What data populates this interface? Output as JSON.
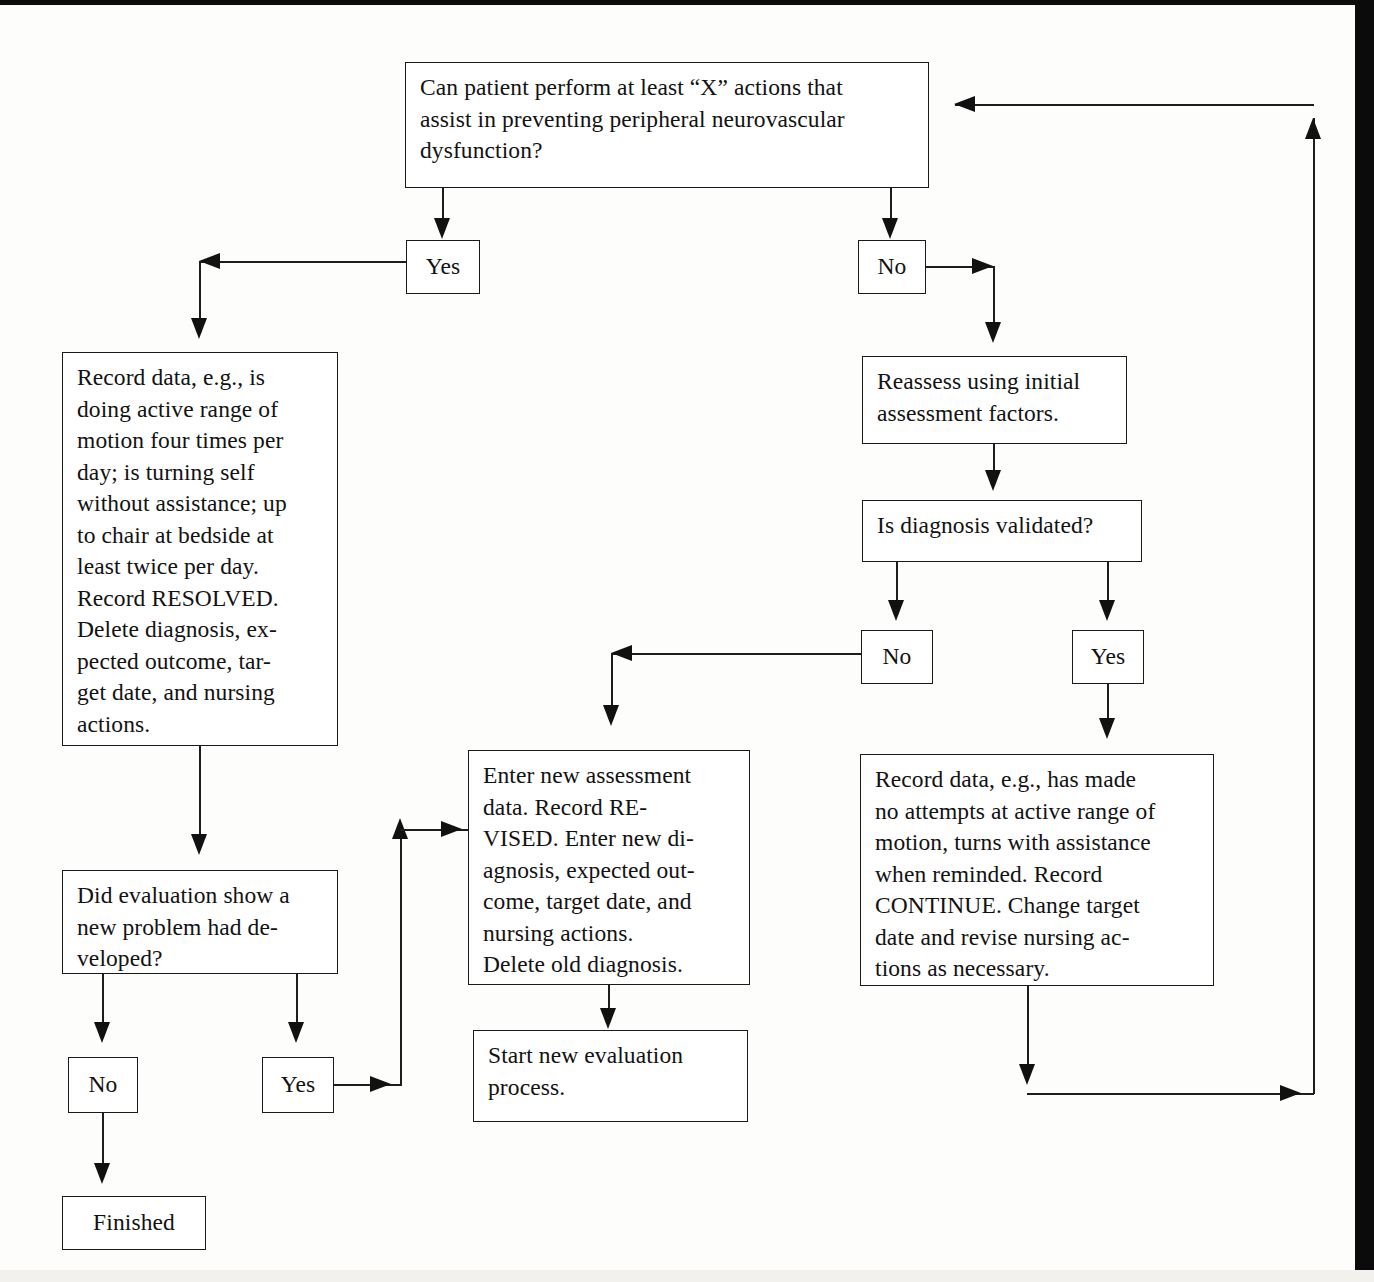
{
  "diagram": {
    "type": "flowchart",
    "nodes": {
      "question_top": {
        "label": "Can patient perform at least “X” actions that\nassist in preventing peripheral neurovascular\ndysfunction?",
        "shape": "rectangle"
      },
      "yes_top": {
        "label": "Yes",
        "shape": "rectangle"
      },
      "no_top": {
        "label": "No",
        "shape": "rectangle"
      },
      "record_resolved": {
        "label": "Record data, e.g., is\ndoing active range of\nmotion four times per\nday; is turning self\nwithout assistance; up\nto chair at bedside at\nleast twice per day.\nRecord RESOLVED.\nDelete diagnosis, ex-\npected outcome, tar-\nget date, and nursing\nactions.",
        "shape": "rectangle"
      },
      "reassess": {
        "label": "Reassess using initial\nassessment factors.",
        "shape": "rectangle"
      },
      "is_validated": {
        "label": "Is diagnosis validated?",
        "shape": "rectangle"
      },
      "no_mid": {
        "label": "No",
        "shape": "rectangle"
      },
      "yes_mid": {
        "label": "Yes",
        "shape": "rectangle"
      },
      "did_evaluation": {
        "label": "Did evaluation show a\nnew problem had de-\nveloped?",
        "shape": "rectangle"
      },
      "enter_new": {
        "label": "Enter new assessment\ndata. Record RE-\nVISED. Enter new di-\nagnosis, expected out-\ncome, target date, and\nnursing actions.\nDelete old diagnosis.",
        "shape": "rectangle"
      },
      "record_continue": {
        "label": "Record data, e.g., has made\nno attempts at active range of\nmotion, turns with assistance\nwhen reminded. Record\nCONTINUE. Change target\ndate and revise nursing ac-\ntions as necessary.",
        "shape": "rectangle"
      },
      "no_bottom": {
        "label": "No",
        "shape": "rectangle"
      },
      "yes_bottom": {
        "label": "Yes",
        "shape": "rectangle"
      },
      "start_new": {
        "label": "Start new evaluation\nprocess.",
        "shape": "rectangle"
      },
      "finished": {
        "label": "Finished",
        "shape": "rectangle"
      }
    },
    "edges": [
      {
        "from": "question_top",
        "to": "yes_top",
        "label": ""
      },
      {
        "from": "question_top",
        "to": "no_top",
        "label": ""
      },
      {
        "from": "yes_top",
        "to": "record_resolved",
        "label": ""
      },
      {
        "from": "no_top",
        "to": "reassess",
        "label": ""
      },
      {
        "from": "reassess",
        "to": "is_validated",
        "label": ""
      },
      {
        "from": "is_validated",
        "to": "no_mid",
        "label": ""
      },
      {
        "from": "is_validated",
        "to": "yes_mid",
        "label": ""
      },
      {
        "from": "no_mid",
        "to": "enter_new",
        "label": ""
      },
      {
        "from": "yes_mid",
        "to": "record_continue",
        "label": ""
      },
      {
        "from": "record_resolved",
        "to": "did_evaluation",
        "label": ""
      },
      {
        "from": "did_evaluation",
        "to": "no_bottom",
        "label": ""
      },
      {
        "from": "did_evaluation",
        "to": "yes_bottom",
        "label": ""
      },
      {
        "from": "no_bottom",
        "to": "finished",
        "label": ""
      },
      {
        "from": "yes_bottom",
        "to": "enter_new",
        "label": ""
      },
      {
        "from": "enter_new",
        "to": "start_new",
        "label": ""
      },
      {
        "from": "record_continue",
        "to": "question_top",
        "label": ""
      }
    ],
    "colors": {
      "line": "#1d1d1d",
      "box_border": "#1a1a1a",
      "box_fill": "#ffffff",
      "page": "#fdfdfb",
      "scan_edge": "#0b0b0b"
    }
  }
}
